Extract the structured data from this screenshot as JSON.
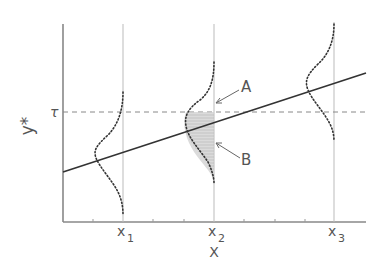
{
  "diagram": {
    "type": "tobit-censoring-illustration",
    "y_axis_label": "y*",
    "x_axis_label": "X",
    "threshold_label": "τ",
    "x_ticks": [
      {
        "label": "x",
        "subscript": "1"
      },
      {
        "label": "x",
        "subscript": "2"
      },
      {
        "label": "x",
        "subscript": "3"
      }
    ],
    "annotations": [
      {
        "label": "A",
        "points_to": "point on x2 line at threshold"
      },
      {
        "label": "B",
        "points_to": "shaded area below threshold at x2"
      }
    ],
    "elements": {
      "regression_line": "solid line increasing with X",
      "threshold_line": "dashed horizontal line at τ",
      "distributions": "dotted normal densities centered on regression line at x1, x2, x3"
    },
    "colors": {
      "axis": "#888888",
      "line": "#333333",
      "dots": "#333333",
      "text": "#555555"
    }
  }
}
